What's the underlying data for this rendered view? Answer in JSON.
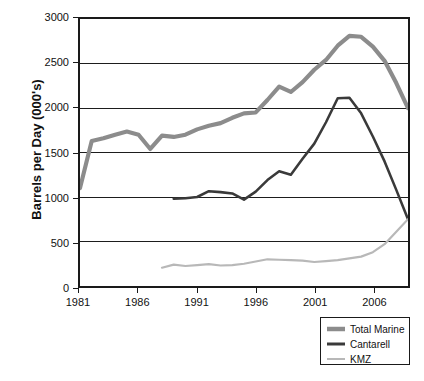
{
  "chart_data": {
    "type": "line",
    "title": "",
    "xlabel": "",
    "ylabel": "Barrels per Day (000's)",
    "xlim": [
      1981,
      2009
    ],
    "ylim": [
      0,
      3000
    ],
    "yticks": [
      0,
      500,
      1000,
      1500,
      2000,
      2500,
      3000
    ],
    "ytick_labels": [
      "0",
      "500",
      "1000",
      "1500",
      "2000",
      "2500",
      "3000"
    ],
    "xticks": [
      1981,
      1986,
      1991,
      1996,
      2001,
      2006
    ],
    "xtick_labels": [
      "1981",
      "1986",
      "1991",
      "1996",
      "2001",
      "2006"
    ],
    "grid": "horizontal",
    "legend_position": "bottom-right",
    "series": [
      {
        "name": "Total Marine",
        "color": "#8c8c8c",
        "width": 4.2,
        "x": [
          1981,
          1982,
          1983,
          1984,
          1985,
          1986,
          1987,
          1988,
          1989,
          1990,
          1991,
          1992,
          1993,
          1994,
          1995,
          1996,
          1997,
          1998,
          1999,
          2000,
          2001,
          2002,
          2003,
          2004,
          2005,
          2006,
          2007,
          2008,
          2009
        ],
        "y": [
          1100,
          1630,
          1660,
          1700,
          1735,
          1700,
          1540,
          1690,
          1675,
          1700,
          1760,
          1800,
          1830,
          1890,
          1940,
          1950,
          2090,
          2240,
          2180,
          2290,
          2430,
          2540,
          2700,
          2810,
          2800,
          2690,
          2530,
          2280,
          2000
        ]
      },
      {
        "name": "Cantarell",
        "color": "#3a3a3a",
        "width": 2.6,
        "x": [
          1989,
          1990,
          1991,
          1992,
          1993,
          1994,
          1995,
          1996,
          1997,
          1998,
          1999,
          2000,
          2001,
          2002,
          2003,
          2004,
          2005,
          2006,
          2007,
          2008,
          2009
        ],
        "y": [
          980,
          985,
          1000,
          1065,
          1055,
          1040,
          970,
          1060,
          1190,
          1290,
          1250,
          1430,
          1600,
          1840,
          2110,
          2115,
          1940,
          1680,
          1400,
          1080,
          750
        ]
      },
      {
        "name": "KMZ",
        "color": "#b8b8b8",
        "width": 2.2,
        "x": [
          1988,
          1989,
          1990,
          1991,
          1992,
          1993,
          1994,
          1995,
          1996,
          1997,
          1998,
          1999,
          2000,
          2001,
          2002,
          2003,
          2004,
          2005,
          2006,
          2007,
          2008,
          2009
        ],
        "y": [
          205,
          240,
          225,
          235,
          245,
          230,
          235,
          250,
          275,
          300,
          295,
          290,
          285,
          270,
          280,
          290,
          310,
          330,
          380,
          470,
          610,
          750
        ]
      }
    ]
  },
  "legend": {
    "items": [
      {
        "label": "Total Marine"
      },
      {
        "label": "Cantarell"
      },
      {
        "label": "KMZ"
      }
    ]
  }
}
